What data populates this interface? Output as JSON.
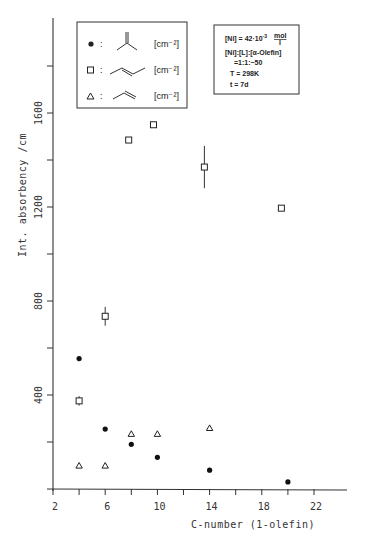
{
  "chart_data": {
    "type": "scatter",
    "title": "",
    "xlabel": "C-number (1-olefin)",
    "ylabel": "Int. absorbency /cm",
    "xlim": [
      2,
      24
    ],
    "ylim": [
      0,
      2000
    ],
    "x_ticks": [
      2,
      4,
      6,
      8,
      10,
      12,
      14,
      16,
      18,
      20,
      22
    ],
    "x_tick_labels": [
      "2",
      "6",
      "10",
      "14",
      "18",
      "22"
    ],
    "y_ticks": [
      0,
      200,
      400,
      600,
      800,
      1000,
      1200,
      1400,
      1600,
      1800
    ],
    "y_tick_labels": [
      "400",
      "800",
      "1200",
      "1600"
    ],
    "grid": false,
    "legend_position": "upper left (inside)",
    "series": [
      {
        "name": "isobutene-type (vinylidene) [cm^-2]",
        "marker": "filled-circle",
        "points": [
          [
            4,
            555
          ],
          [
            6,
            255
          ],
          [
            8,
            190
          ],
          [
            10,
            135
          ],
          [
            14,
            80
          ],
          [
            20,
            30
          ]
        ]
      },
      {
        "name": "trans-internal olefin [cm^-2]",
        "marker": "open-square",
        "points": [
          [
            4,
            375
          ],
          [
            6,
            735
          ],
          [
            7.8,
            1485
          ],
          [
            9.7,
            1550
          ],
          [
            13.6,
            1370
          ],
          [
            19.5,
            1195
          ]
        ],
        "error_bars": [
          [
            4,
            20
          ],
          [
            6,
            40
          ],
          null,
          null,
          [
            13.6,
            90
          ],
          null
        ]
      },
      {
        "name": "terminal (1-olefin) [cm^-2]",
        "marker": "open-triangle",
        "points": [
          [
            4,
            100
          ],
          [
            6,
            100
          ],
          [
            8,
            235
          ],
          [
            10,
            235
          ],
          [
            14,
            260
          ]
        ]
      }
    ],
    "annotations": [
      "[Ni] = 42·10^-3 mol/l",
      "[Ni]:[L]:[α-Olefin] = 1:1:~50",
      "T = 298K",
      "t = 7d"
    ]
  },
  "legend": {
    "items": [
      {
        "marker": "filled-circle",
        "unit": "[cm⁻²]"
      },
      {
        "marker": "open-square",
        "unit": "[cm⁻²]"
      },
      {
        "marker": "open-triangle",
        "unit": "[cm⁻²]"
      }
    ]
  },
  "conditions": {
    "line1": "[Ni] = 42·10",
    "line1_exp": "-3",
    "line1_unit_num": "mol",
    "line1_unit_den": "l",
    "line2": "[Ni]:[L]:[α-Olefin]",
    "line3": "=1:1:~50",
    "line4": "T = 298K",
    "line5": "t = 7d"
  },
  "axes": {
    "x_title": "C-number (1-olefin)",
    "y_title": "Int. absorbency /cm",
    "x_labels": [
      {
        "v": 2,
        "t": "2"
      },
      {
        "v": 6,
        "t": "6"
      },
      {
        "v": 10,
        "t": "10"
      },
      {
        "v": 14,
        "t": "14"
      },
      {
        "v": 18,
        "t": "18"
      },
      {
        "v": 22,
        "t": "22"
      }
    ],
    "y_labels": [
      {
        "v": 400,
        "t": "400"
      },
      {
        "v": 800,
        "t": "800"
      },
      {
        "v": 1200,
        "t": "1200"
      },
      {
        "v": 1600,
        "t": "1600"
      }
    ]
  }
}
